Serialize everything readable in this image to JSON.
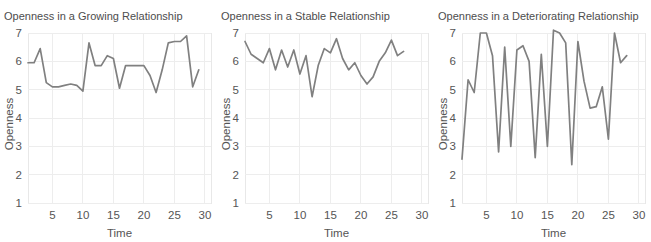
{
  "figure": {
    "panel_count": 3,
    "line_color": "#808080",
    "grid_color": "#ededed",
    "text_color": "#555555",
    "background": "#ffffff"
  },
  "chart_data": [
    {
      "type": "line",
      "title": "Openness in a Growing Relationship",
      "xlabel": "Time",
      "ylabel": "Openness",
      "xlim": [
        1,
        31
      ],
      "ylim": [
        1,
        7
      ],
      "xticks": [
        5,
        10,
        15,
        20,
        25,
        30
      ],
      "yticks": [
        1,
        2,
        3,
        4,
        5,
        6,
        7
      ],
      "grid": true,
      "legend": "none",
      "x": [
        1,
        2,
        3,
        4,
        5,
        6,
        7,
        8,
        9,
        10,
        11,
        12,
        13,
        14,
        15,
        16,
        17,
        18,
        19,
        20,
        21,
        22,
        23,
        24,
        25,
        26,
        27,
        28,
        29
      ],
      "values": [
        5.95,
        5.95,
        6.45,
        5.25,
        5.1,
        5.1,
        5.15,
        5.2,
        5.15,
        4.95,
        6.65,
        5.85,
        5.85,
        6.2,
        6.1,
        5.05,
        5.85,
        5.85,
        5.85,
        5.85,
        5.5,
        4.9,
        5.7,
        6.65,
        6.7,
        6.7,
        6.9,
        5.1,
        5.7
      ]
    },
    {
      "type": "line",
      "title": "Openness in a Stable Relationship",
      "xlabel": "Time",
      "ylabel": "Openness",
      "xlim": [
        1,
        31
      ],
      "ylim": [
        1,
        7
      ],
      "xticks": [
        5,
        10,
        15,
        20,
        25,
        30
      ],
      "yticks": [
        1,
        2,
        3,
        4,
        5,
        6,
        7
      ],
      "grid": true,
      "legend": "none",
      "x": [
        1,
        2,
        3,
        4,
        5,
        6,
        7,
        8,
        9,
        10,
        11,
        12,
        13,
        14,
        15,
        16,
        17,
        18,
        19,
        20,
        21,
        22,
        23,
        24,
        25,
        26,
        27
      ],
      "values": [
        6.7,
        6.25,
        6.1,
        5.95,
        6.45,
        5.7,
        6.4,
        5.8,
        6.4,
        5.55,
        6.2,
        4.75,
        5.85,
        6.45,
        6.3,
        6.8,
        6.1,
        5.7,
        5.95,
        5.5,
        5.2,
        5.45,
        6.0,
        6.3,
        6.75,
        6.2,
        6.35
      ]
    },
    {
      "type": "line",
      "title": "Openness in a Deteriorating Relationship",
      "xlabel": "Time",
      "ylabel": "Openness",
      "xlim": [
        1,
        31
      ],
      "ylim": [
        1,
        7
      ],
      "xticks": [
        5,
        10,
        15,
        20,
        25,
        30
      ],
      "yticks": [
        1,
        2,
        3,
        4,
        5,
        6,
        7
      ],
      "grid": true,
      "legend": "none",
      "x": [
        1,
        2,
        3,
        4,
        5,
        6,
        7,
        8,
        9,
        10,
        11,
        12,
        13,
        14,
        15,
        16,
        17,
        18,
        19,
        20,
        21,
        22,
        23,
        24,
        25,
        26,
        27,
        28
      ],
      "values": [
        2.55,
        5.35,
        4.9,
        7.0,
        7.0,
        6.2,
        2.8,
        6.5,
        3.0,
        6.4,
        6.55,
        6.0,
        2.6,
        6.25,
        3.0,
        7.1,
        7.0,
        6.65,
        2.35,
        6.7,
        5.3,
        4.35,
        4.4,
        5.1,
        3.25,
        7.0,
        5.95,
        6.2
      ]
    }
  ]
}
